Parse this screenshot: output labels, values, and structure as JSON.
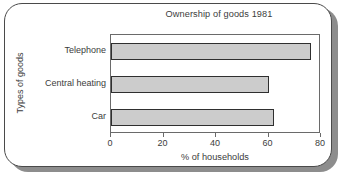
{
  "chart_data": {
    "type": "bar",
    "orientation": "horizontal",
    "title": "Ownership of goods 1981",
    "xlabel": "% of households",
    "ylabel": "Types of goods",
    "categories": [
      "Telephone",
      "Central heating",
      "Car"
    ],
    "values": [
      76,
      60,
      62
    ],
    "xlim": [
      0,
      80
    ],
    "xticks": [
      0,
      20,
      40,
      60,
      80
    ],
    "xtick_labels": [
      "0",
      "20",
      "40",
      "60",
      "80"
    ],
    "grid": false,
    "legend": false,
    "bar_fill_color": "#cccccc",
    "bar_edge_color": "#2f2f2f",
    "frame_color": "#4a4a4a"
  }
}
